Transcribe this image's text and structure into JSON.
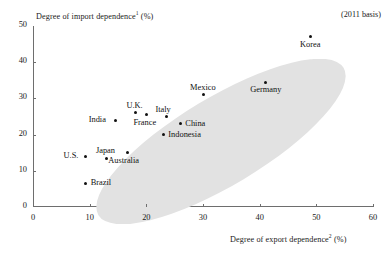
{
  "figure": {
    "basis_note": "(2011 basis)",
    "y_axis_title": "Degree of import dependence",
    "y_axis_title_sup": "1",
    "y_axis_title_unit": " (%)",
    "x_axis_title": "Degree of export dependence",
    "x_axis_title_sup": "2",
    "x_axis_title_unit": " (%)"
  },
  "chart_data": {
    "type": "scatter",
    "title": "",
    "xlabel": "Degree of export dependence2 (%)",
    "ylabel": "Degree of import dependence1 (%)",
    "xlim": [
      0,
      60
    ],
    "ylim": [
      0,
      50
    ],
    "xticks": [
      0,
      10,
      20,
      30,
      40,
      50,
      60
    ],
    "yticks": [
      0,
      10,
      20,
      30,
      40,
      50
    ],
    "grid": false,
    "legend": null,
    "annotations": [
      "(2011 basis)"
    ],
    "trend_shape": "shaded ellipse enclosing all points, oriented lower-left to upper-right",
    "points": [
      {
        "label": "Korea",
        "x": 49,
        "y": 47,
        "label_pos": "below"
      },
      {
        "label": "Germany",
        "x": 41,
        "y": 34.5,
        "label_pos": "below"
      },
      {
        "label": "Mexico",
        "x": 30,
        "y": 31,
        "label_pos": "above"
      },
      {
        "label": "Italy",
        "x": 23.5,
        "y": 25,
        "label_pos": "above"
      },
      {
        "label": "China",
        "x": 26,
        "y": 23,
        "label_pos": "right"
      },
      {
        "label": "Indonesia",
        "x": 23,
        "y": 20,
        "label_pos": "right"
      },
      {
        "label": "U.K.",
        "x": 18,
        "y": 26,
        "label_pos": "above"
      },
      {
        "label": "France",
        "x": 20,
        "y": 25.5,
        "label_pos": "below"
      },
      {
        "label": "India",
        "x": 14.5,
        "y": 24,
        "label_pos": "left"
      },
      {
        "label": "Australia",
        "x": 16.7,
        "y": 15,
        "label_pos": "below"
      },
      {
        "label": "Japan",
        "x": 13,
        "y": 13.5,
        "label_pos": "above"
      },
      {
        "label": "U.S.",
        "x": 9.3,
        "y": 14,
        "label_pos": "left"
      },
      {
        "label": "Brazil",
        "x": 9.3,
        "y": 6.5,
        "label_pos": "right"
      }
    ]
  }
}
